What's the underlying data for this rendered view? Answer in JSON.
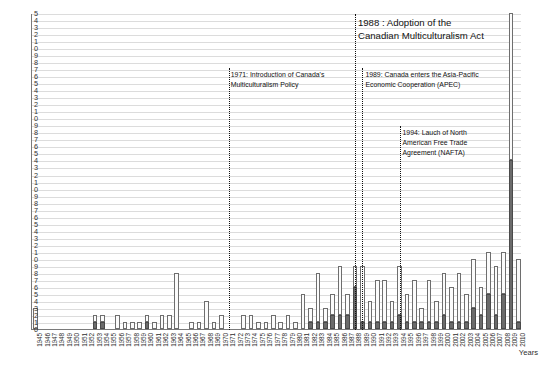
{
  "axis_title_x": "Years",
  "chart_data": {
    "type": "bar",
    "title": "",
    "subtitle": "",
    "xlabel": "Years",
    "ylabel": "",
    "ylim": [
      0,
      45
    ],
    "ytick_step": 1,
    "grid": true,
    "legend_position": "none",
    "stacked": true,
    "note": "Y axis tick labels are clipped at the left edge of the image so only the final digit of each value is rendered (e.g. 45 shows as '5', 44 as '4', 10 as '0').",
    "ytick_labels_rendered": [
      "5",
      "4",
      "3",
      "2",
      "1",
      "0",
      "9",
      "8",
      "7",
      "6",
      "5",
      "4",
      "3",
      "2",
      "1",
      "0",
      "9",
      "8",
      "7",
      "6",
      "5",
      "4",
      "3",
      "2",
      "1",
      "0",
      "9",
      "8",
      "7",
      "6",
      "5",
      "4",
      "3",
      "2",
      "1",
      "0",
      "9",
      "8",
      "7",
      "6",
      "5",
      "4",
      "3",
      "2",
      "1",
      "0"
    ],
    "ytick_values": [
      45,
      44,
      43,
      42,
      41,
      40,
      39,
      38,
      37,
      36,
      35,
      34,
      33,
      32,
      31,
      30,
      29,
      28,
      27,
      26,
      25,
      24,
      23,
      22,
      21,
      20,
      19,
      18,
      17,
      16,
      15,
      14,
      13,
      12,
      11,
      10,
      9,
      8,
      7,
      6,
      5,
      4,
      3,
      2,
      1,
      0
    ],
    "categories": [
      "1945",
      "1946",
      "1947",
      "1948",
      "1949",
      "1950",
      "1951",
      "1952",
      "1953",
      "1954",
      "1955",
      "1956",
      "1957",
      "1958",
      "1959",
      "1960",
      "1961",
      "1962",
      "1963",
      "1964",
      "1965",
      "1966",
      "1967",
      "1968",
      "1969",
      "1970",
      "1971",
      "1972",
      "1973",
      "1974",
      "1975",
      "1976",
      "1977",
      "1978",
      "1979",
      "1980",
      "1981",
      "1982",
      "1983",
      "1984",
      "1985",
      "1986",
      "1987",
      "1988",
      "1989",
      "1990",
      "1991",
      "1992",
      "1993",
      "1994",
      "1995",
      "1996",
      "1997",
      "1998",
      "1999",
      "2000",
      "2001",
      "2002",
      "2003",
      "2004",
      "2005",
      "2006",
      "2007",
      "2008",
      "2009",
      "2010"
    ],
    "series": [
      {
        "name": "lower-segment",
        "color": "#6b6b6b",
        "values": [
          0,
          0,
          0,
          0,
          0,
          0,
          0,
          0,
          1,
          1,
          0,
          0,
          0,
          0,
          0,
          1,
          0,
          0,
          0,
          0,
          0,
          0,
          0,
          0,
          0,
          0,
          0,
          0,
          0,
          0,
          0,
          0,
          0,
          0,
          0,
          0,
          0,
          1,
          1,
          1,
          2,
          2,
          2,
          6,
          1,
          1,
          1,
          1,
          1,
          2,
          1,
          1,
          1,
          1,
          1,
          2,
          1,
          1,
          1,
          3,
          2,
          5,
          2,
          5,
          24,
          1
        ]
      },
      {
        "name": "upper-segment",
        "color": "#fbfbfb",
        "values": [
          3,
          0,
          0,
          0,
          0,
          0,
          0,
          0,
          1,
          1,
          0,
          2,
          1,
          1,
          1,
          1,
          1,
          2,
          2,
          8,
          0,
          1,
          1,
          4,
          1,
          2,
          0,
          0,
          2,
          2,
          1,
          1,
          2,
          1,
          2,
          1,
          5,
          2,
          7,
          2,
          3,
          7,
          3,
          3,
          8,
          3,
          6,
          6,
          3,
          7,
          4,
          6,
          2,
          6,
          3,
          6,
          5,
          7,
          4,
          7,
          4,
          6,
          7,
          6,
          21,
          9
        ]
      }
    ],
    "totals": [
      3,
      0,
      0,
      0,
      0,
      0,
      0,
      0,
      2,
      2,
      0,
      2,
      1,
      1,
      1,
      2,
      1,
      2,
      2,
      8,
      0,
      1,
      1,
      4,
      1,
      2,
      0,
      0,
      2,
      2,
      1,
      1,
      2,
      1,
      2,
      1,
      5,
      3,
      8,
      3,
      5,
      9,
      5,
      9,
      9,
      4,
      7,
      7,
      4,
      9,
      5,
      7,
      3,
      7,
      4,
      8,
      6,
      8,
      5,
      10,
      6,
      11,
      9,
      11,
      45,
      10
    ],
    "annotations": [
      {
        "id": "ann-1971",
        "year": 1971,
        "text": "1971: Introduction of Canada's\nMulticulturalism Policy",
        "size": "small"
      },
      {
        "id": "ann-1988",
        "year": 1988,
        "text": "1988 : Adoption of the\nCanadian Multiculturalism Act",
        "size": "large"
      },
      {
        "id": "ann-1989",
        "year": 1989,
        "text": "1989: Canada enters the Asia-Pacific\nEconomic Cooperation (APEC)",
        "size": "small"
      },
      {
        "id": "ann-1994",
        "year": 1994,
        "text": "1994: Lauch of North\nAmerican Free Trade\nAgreement (NAFTA)",
        "size": "small"
      }
    ]
  },
  "colors": {
    "bar_lower": "#6b6b6b",
    "bar_upper": "#fbfbfb",
    "bar_stroke": "#6e6e6e",
    "grid": "#dcdcdc",
    "axis": "#7a7a7a",
    "text": "#222222",
    "annotation_line": "#111111"
  }
}
